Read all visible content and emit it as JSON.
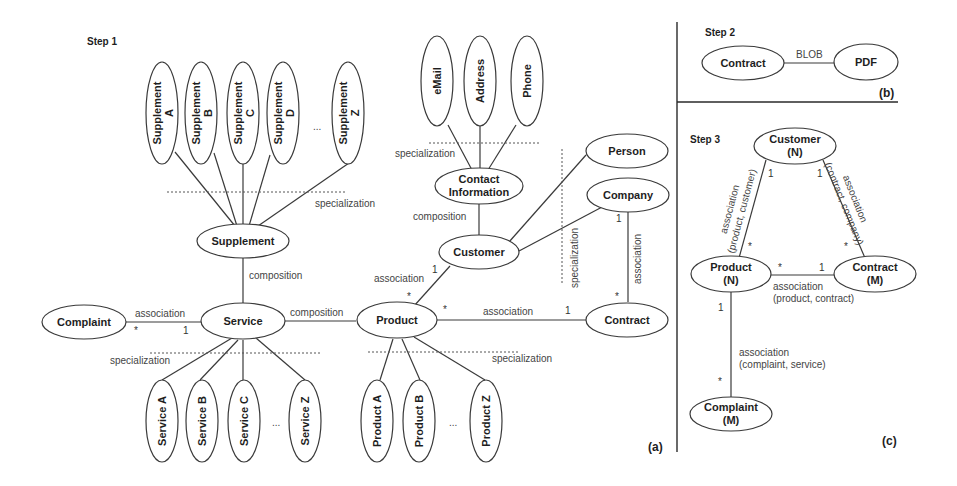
{
  "panels": {
    "a": {
      "step": "Step 1",
      "label": "(a)",
      "entities": {
        "supplement_a": "Supplement A",
        "supplement_b": "Supplement B",
        "supplement_c": "Supplement C",
        "supplement_d": "Supplement D",
        "supplement_z": "Supplement Z",
        "supplement_a_l1": "Supplement",
        "supplement_a_l2": "A",
        "supplement_b_l1": "Supplement",
        "supplement_b_l2": "B",
        "supplement_c_l1": "Supplement",
        "supplement_c_l2": "C",
        "supplement_d_l1": "Supplement",
        "supplement_d_l2": "D",
        "supplement_z_l1": "Supplement",
        "supplement_z_l2": "Z",
        "supplement": "Supplement",
        "service": "Service",
        "complaint": "Complaint",
        "product": "Product",
        "customer": "Customer",
        "contact_l1": "Contact",
        "contact_l2": "Information",
        "email": "eMail",
        "address": "Address",
        "phone": "Phone",
        "person": "Person",
        "company": "Company",
        "contract": "Contract",
        "service_a": "Service A",
        "service_b": "Service B",
        "service_c": "Service C",
        "service_z": "Service Z",
        "product_a": "Product A",
        "product_b": "Product B",
        "product_z": "Product Z"
      },
      "ellipsis": "...",
      "relations": {
        "spec_supplement": "specialization",
        "comp_supplement_service": "composition",
        "assoc_complaint_service": "association",
        "comp_service_product": "composition",
        "spec_service": "specialization",
        "spec_product": "specialization",
        "spec_contact": "specialization",
        "comp_contact_customer": "composition",
        "assoc_product_customer": "association",
        "spec_customer": "specialization",
        "assoc_company_contract": "association",
        "assoc_product_contract": "association"
      },
      "cardinalities": {
        "complaint_side": "*",
        "service_side": "1",
        "customer_side": "1",
        "product_cust_side": "*",
        "product_contract_side": "*",
        "contract_side": "1",
        "company_side": "1",
        "contract_company_side": "*"
      }
    },
    "b": {
      "step": "Step 2",
      "label": "(b)",
      "entities": {
        "contract": "Contract",
        "pdf": "PDF"
      },
      "relation": "BLOB"
    },
    "c": {
      "step": "Step 3",
      "label": "(c)",
      "entities": {
        "customer": "Customer",
        "customer_m": "(N)",
        "product": "Product",
        "product_m": "(N)",
        "contract": "Contract",
        "contract_m": "(M)",
        "complaint": "Complaint",
        "complaint_m": "(M)"
      },
      "relations": {
        "pc_l1": "association",
        "pc_l2": "(product, customer)",
        "cc_l1": "association",
        "cc_l2": "(contract, company)",
        "pk_l1": "association",
        "pk_l2": "(product, contract)",
        "cs_l1": "association",
        "cs_l2": "(complaint, service)"
      },
      "cardinalities": {
        "cust_prod": "1",
        "prod_cust": "*",
        "cust_contr": "1",
        "contr_cust": "*",
        "prod_contr": "*",
        "contr_prod": "1",
        "prod_compl": "1",
        "compl_prod": "*"
      }
    }
  }
}
